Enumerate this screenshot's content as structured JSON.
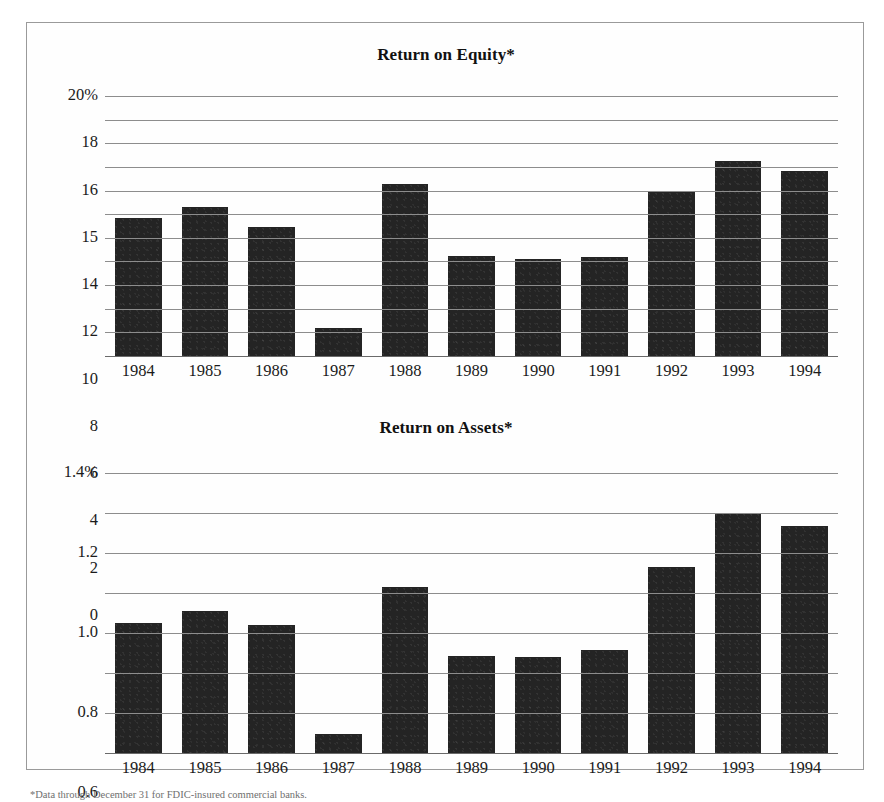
{
  "footnote": "*Data through December 31 for FDIC-insured commercial banks.",
  "charts": [
    {
      "id": "return-on-equity",
      "title": "Return on Equity*",
      "ticks": [
        "20%",
        "18",
        "16",
        "15",
        "14",
        "12",
        "10",
        "8",
        "6",
        "4",
        "2",
        "0"
      ],
      "categories": [
        "1984",
        "1985",
        "1986",
        "1987",
        "1988",
        "1989",
        "1990",
        "1991",
        "1992",
        "1993",
        "1994"
      ],
      "values": [
        10.6,
        11.5,
        9.95,
        2.15,
        13.2,
        7.7,
        7.45,
        7.65,
        12.6,
        15.0,
        14.25
      ]
    },
    {
      "id": "return-on-assets",
      "title": "Return on Assets*",
      "ticks": [
        "1.4%",
        "1.2",
        "1.0",
        "0.8",
        "0.6",
        "0.4",
        "0.2",
        "0"
      ],
      "categories": [
        "1984",
        "1985",
        "1986",
        "1987",
        "1988",
        "1989",
        "1990",
        "1991",
        "1992",
        "1993",
        "1994"
      ],
      "values": [
        0.65,
        0.71,
        0.64,
        0.095,
        0.83,
        0.485,
        0.48,
        0.515,
        0.93,
        1.2,
        1.135
      ]
    }
  ],
  "chart_data": [
    {
      "type": "bar",
      "title": "Return on Equity*",
      "xlabel": "",
      "ylabel": "",
      "categories": [
        "1984",
        "1985",
        "1986",
        "1987",
        "1988",
        "1989",
        "1990",
        "1991",
        "1992",
        "1993",
        "1994"
      ],
      "values": [
        10.6,
        11.5,
        9.95,
        2.15,
        13.2,
        7.7,
        7.45,
        7.65,
        12.6,
        15.0,
        14.25
      ],
      "ytick_labels": [
        "20%",
        "18",
        "16",
        "15",
        "14",
        "12",
        "10",
        "8",
        "6",
        "4",
        "2",
        "0"
      ],
      "ylim": [
        0,
        20
      ],
      "grid": "horizontal",
      "legend": "none",
      "bar_color": "#242424",
      "note": "Scanned original shows evenly spaced gridlines labelled 20,18,16,15,14,12,10,8,6,4,2,0"
    },
    {
      "type": "bar",
      "title": "Return on Assets*",
      "xlabel": "",
      "ylabel": "",
      "categories": [
        "1984",
        "1985",
        "1986",
        "1987",
        "1988",
        "1989",
        "1990",
        "1991",
        "1992",
        "1993",
        "1994"
      ],
      "values": [
        0.65,
        0.71,
        0.64,
        0.095,
        0.83,
        0.485,
        0.48,
        0.515,
        0.93,
        1.2,
        1.135
      ],
      "ytick_labels": [
        "1.4%",
        "1.2",
        "1.0",
        "0.8",
        "0.6",
        "0.4",
        "0.2",
        "0"
      ],
      "ylim": [
        0,
        1.4
      ],
      "grid": "horizontal",
      "legend": "none",
      "bar_color": "#242424"
    }
  ]
}
